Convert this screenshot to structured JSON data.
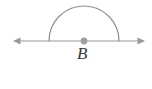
{
  "figure": {
    "kind": "geometry-diagram",
    "background_color": "#ffffff",
    "stroke_color": "#8f8f8f",
    "label_color": "#3a3a3a",
    "point_fill_color": "#a0a0a0",
    "canvas": {
      "width": 152,
      "height": 89
    }
  },
  "line": {
    "name": "horizontal-line-through-B",
    "y": 41,
    "x_start": 13,
    "x_end": 145,
    "stroke_width": 1.2,
    "arrowhead_left": true,
    "arrowhead_right": true
  },
  "arc": {
    "name": "straight-angle-arc",
    "center_x": 84,
    "center_y": 41,
    "radius": 35,
    "start_x": 50,
    "end_x": 118,
    "apex_y": 6,
    "sweep_degrees": 180,
    "stroke_width": 1.2
  },
  "vertex": {
    "name": "point-B",
    "cx": 84,
    "cy": 41,
    "radius": 3.4,
    "label": "B",
    "label_x": 77,
    "label_y": 45
  },
  "legend": {
    "vertex_label": "B"
  }
}
